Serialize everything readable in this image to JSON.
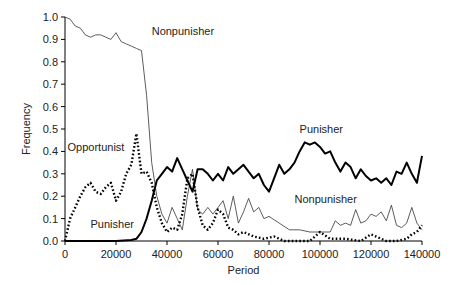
{
  "chart_data": {
    "type": "line",
    "title": "",
    "xlabel": "Period",
    "ylabel": "Frequency",
    "xlim": [
      0,
      140000
    ],
    "ylim": [
      0,
      1.0
    ],
    "x_ticks": [
      0,
      20000,
      40000,
      60000,
      80000,
      100000,
      120000,
      140000
    ],
    "y_ticks": [
      0.0,
      0.1,
      0.2,
      0.3,
      0.4,
      0.5,
      0.6,
      0.7,
      0.8,
      0.9,
      1.0
    ],
    "grid": false,
    "annotations": [
      {
        "text": "Nonpunisher",
        "x": 34000,
        "y": 0.92
      },
      {
        "text": "Opportunist",
        "x": 1000,
        "y": 0.4
      },
      {
        "text": "Punisher",
        "x": 10000,
        "y": 0.06
      },
      {
        "text": "Punisher",
        "x": 92000,
        "y": 0.48
      },
      {
        "text": "Nonpunisher",
        "x": 90000,
        "y": 0.17
      }
    ],
    "series": [
      {
        "name": "Nonpunisher",
        "style": "thin-solid",
        "x": [
          0,
          2000,
          4000,
          6000,
          8000,
          10000,
          12000,
          14000,
          16000,
          18000,
          20000,
          22000,
          24000,
          26000,
          28000,
          30000,
          32000,
          34000,
          36000,
          38000,
          40000,
          42000,
          44000,
          46000,
          48000,
          50000,
          52000,
          54000,
          56000,
          58000,
          60000,
          62000,
          64000,
          66000,
          68000,
          70000,
          72000,
          74000,
          76000,
          78000,
          80000,
          84000,
          88000,
          92000,
          96000,
          100000,
          104000,
          106000,
          108000,
          110000,
          112000,
          114000,
          116000,
          118000,
          120000,
          122000,
          124000,
          126000,
          128000,
          130000,
          132000,
          134000,
          136000,
          138000,
          140000
        ],
        "values": [
          1.0,
          0.99,
          0.96,
          0.95,
          0.92,
          0.91,
          0.92,
          0.92,
          0.91,
          0.9,
          0.93,
          0.89,
          0.88,
          0.87,
          0.86,
          0.85,
          0.65,
          0.35,
          0.2,
          0.12,
          0.08,
          0.15,
          0.1,
          0.05,
          0.2,
          0.32,
          0.14,
          0.12,
          0.15,
          0.12,
          0.15,
          0.18,
          0.1,
          0.2,
          0.08,
          0.13,
          0.19,
          0.13,
          0.15,
          0.1,
          0.11,
          0.08,
          0.05,
          0.05,
          0.04,
          0.04,
          0.04,
          0.09,
          0.07,
          0.08,
          0.07,
          0.14,
          0.08,
          0.09,
          0.12,
          0.11,
          0.13,
          0.09,
          0.16,
          0.07,
          0.06,
          0.08,
          0.15,
          0.08,
          0.05
        ]
      },
      {
        "name": "Punisher",
        "style": "thick-solid",
        "x": [
          0,
          10000,
          20000,
          26000,
          28000,
          30000,
          32000,
          34000,
          36000,
          38000,
          40000,
          42000,
          44000,
          46000,
          48000,
          50000,
          52000,
          54000,
          56000,
          58000,
          60000,
          62000,
          64000,
          66000,
          68000,
          70000,
          72000,
          74000,
          76000,
          78000,
          80000,
          82000,
          84000,
          86000,
          88000,
          90000,
          92000,
          94000,
          96000,
          98000,
          100000,
          102000,
          104000,
          106000,
          108000,
          110000,
          112000,
          114000,
          116000,
          118000,
          120000,
          122000,
          124000,
          126000,
          128000,
          130000,
          132000,
          134000,
          136000,
          138000,
          140000
        ],
        "values": [
          0.0,
          0.0,
          0.0,
          0.005,
          0.01,
          0.04,
          0.1,
          0.18,
          0.27,
          0.3,
          0.33,
          0.31,
          0.37,
          0.32,
          0.27,
          0.22,
          0.32,
          0.32,
          0.3,
          0.27,
          0.3,
          0.27,
          0.33,
          0.3,
          0.32,
          0.34,
          0.31,
          0.28,
          0.3,
          0.25,
          0.22,
          0.28,
          0.34,
          0.3,
          0.32,
          0.35,
          0.4,
          0.44,
          0.43,
          0.44,
          0.42,
          0.39,
          0.4,
          0.35,
          0.31,
          0.35,
          0.33,
          0.28,
          0.32,
          0.29,
          0.27,
          0.28,
          0.26,
          0.28,
          0.25,
          0.31,
          0.3,
          0.35,
          0.3,
          0.26,
          0.38
        ]
      },
      {
        "name": "Opportunist",
        "style": "dotted",
        "x": [
          0,
          2000,
          4000,
          6000,
          8000,
          10000,
          12000,
          14000,
          16000,
          18000,
          20000,
          22000,
          24000,
          26000,
          28000,
          30000,
          32000,
          34000,
          36000,
          38000,
          40000,
          42000,
          44000,
          46000,
          48000,
          50000,
          52000,
          54000,
          56000,
          58000,
          60000,
          62000,
          64000,
          66000,
          68000,
          70000,
          74000,
          78000,
          82000,
          86000,
          90000,
          96000,
          100000,
          104000,
          110000,
          116000,
          120000,
          126000,
          130000,
          134000,
          136000,
          138000,
          140000
        ],
        "values": [
          0.0,
          0.1,
          0.15,
          0.2,
          0.24,
          0.26,
          0.22,
          0.21,
          0.24,
          0.26,
          0.18,
          0.22,
          0.3,
          0.34,
          0.48,
          0.3,
          0.31,
          0.26,
          0.15,
          0.08,
          0.04,
          0.06,
          0.05,
          0.12,
          0.28,
          0.3,
          0.15,
          0.07,
          0.05,
          0.08,
          0.14,
          0.12,
          0.06,
          0.05,
          0.03,
          0.04,
          0.02,
          0.01,
          0.02,
          0.0,
          0.0,
          0.0,
          0.04,
          0.01,
          0.01,
          0.0,
          0.03,
          0.0,
          0.0,
          0.01,
          0.03,
          0.04,
          0.07
        ]
      }
    ]
  }
}
